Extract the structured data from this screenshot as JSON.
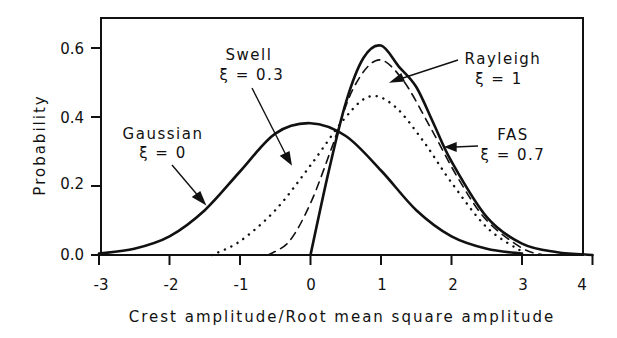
{
  "chart_data": {
    "type": "line",
    "title": "",
    "xlabel": "Crest amplitude/Root mean square amplitude",
    "ylabel": "Probability",
    "xlim": [
      -3,
      4
    ],
    "ylim": [
      0,
      0.67
    ],
    "xticks": [
      -3,
      -2,
      -1,
      0,
      1,
      2,
      3,
      4
    ],
    "xtick_labels": [
      "-3",
      "-2",
      "-1",
      "0",
      "1",
      "2",
      "3",
      "4"
    ],
    "yticks": [
      0.0,
      0.2,
      0.4,
      0.6
    ],
    "ytick_labels": [
      "0.0",
      "0.2",
      "0.4",
      "0.6"
    ],
    "grid": false,
    "legend": "none (inline annotations with arrows)",
    "series": [
      {
        "name": "Gaussian ξ = 0",
        "style": "solid",
        "x": [
          -3.0,
          -2.5,
          -2.0,
          -1.5,
          -1.0,
          -0.5,
          0.0,
          0.5,
          1.0,
          1.5,
          2.0,
          2.5,
          3.0
        ],
        "y": [
          0.004,
          0.018,
          0.054,
          0.13,
          0.242,
          0.352,
          0.382,
          0.345,
          0.245,
          0.13,
          0.054,
          0.018,
          0.004
        ]
      },
      {
        "name": "Swell ξ = 0.3",
        "style": "dotted",
        "x": [
          -1.4,
          -1.0,
          -0.5,
          0.0,
          0.5,
          0.85,
          1.2,
          1.6,
          2.0,
          2.5,
          3.0
        ],
        "y": [
          0.0,
          0.04,
          0.13,
          0.26,
          0.4,
          0.46,
          0.43,
          0.33,
          0.21,
          0.08,
          0.01
        ]
      },
      {
        "name": "FAS ξ = 0.7",
        "style": "dashed",
        "x": [
          -0.6,
          -0.3,
          0.0,
          0.3,
          0.6,
          0.95,
          1.3,
          1.7,
          2.1,
          2.5,
          3.0,
          3.3
        ],
        "y": [
          0.0,
          0.04,
          0.15,
          0.31,
          0.48,
          0.565,
          0.51,
          0.37,
          0.22,
          0.1,
          0.02,
          0.0
        ]
      },
      {
        "name": "Rayleigh ξ = 1",
        "style": "solid",
        "x": [
          0.0,
          0.25,
          0.5,
          0.75,
          1.0,
          1.25,
          1.5,
          1.75,
          2.0,
          2.5,
          3.0,
          3.5,
          4.0
        ],
        "y": [
          0.0,
          0.235,
          0.441,
          0.571,
          0.607,
          0.547,
          0.487,
          0.379,
          0.271,
          0.11,
          0.033,
          0.008,
          0.0
        ]
      }
    ],
    "annotations": [
      {
        "line1": "Gaussian",
        "line2": "ξ = 0",
        "arrow_to": [
          -1.35,
          0.17
        ]
      },
      {
        "line1": "Swell",
        "line2": "ξ = 0.3",
        "arrow_to": [
          -0.28,
          0.21
        ]
      },
      {
        "line1": "Rayleigh",
        "line2": "ξ = 1",
        "arrow_to": [
          1.25,
          0.56
        ]
      },
      {
        "line1": "FAS",
        "line2": "ξ = 0.7",
        "arrow_to": [
          1.93,
          0.31
        ]
      }
    ]
  }
}
